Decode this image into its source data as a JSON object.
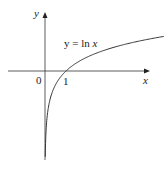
{
  "chart_data": {
    "type": "line",
    "title": "",
    "xlabel": "x",
    "ylabel": "y",
    "series": [
      {
        "name": "y = ln x",
        "function": "ln(x)",
        "label": "y = ln x"
      }
    ],
    "x_ticks": [
      "0",
      "1"
    ],
    "annotations": [
      "y = ln x"
    ],
    "points": [
      [
        0.05,
        -3.0
      ],
      [
        0.1,
        -2.3
      ],
      [
        0.25,
        -1.39
      ],
      [
        0.5,
        -0.69
      ],
      [
        1,
        0
      ],
      [
        2,
        0.69
      ],
      [
        3,
        1.1
      ],
      [
        4,
        1.39
      ],
      [
        5,
        1.61
      ],
      [
        6,
        1.79
      ],
      [
        7,
        1.95
      ]
    ],
    "grid": false
  },
  "labels": {
    "y_axis": "y",
    "x_axis": "x",
    "origin": "0",
    "one": "1",
    "curve_eq_prefix": "y = ln ",
    "curve_eq_var": "x"
  }
}
